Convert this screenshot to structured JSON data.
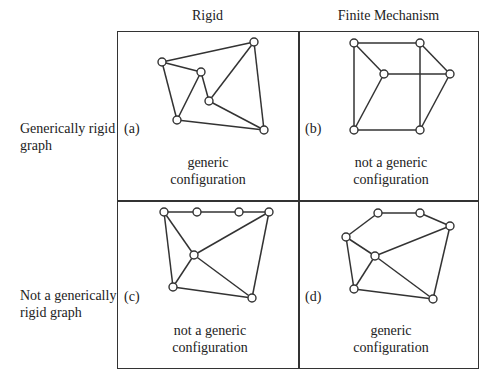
{
  "columns": {
    "rigid": "Rigid",
    "finite_mechanism": "Finite Mechanism"
  },
  "rows": {
    "generically_rigid": [
      "Generically rigid",
      "graph"
    ],
    "not_generically_rigid": [
      "Not a generically",
      "rigid graph"
    ]
  },
  "panels": {
    "a": {
      "tag": "(a)",
      "caption": [
        "generic",
        "configuration"
      ],
      "nodes": [
        [
          162,
          62
        ],
        [
          254,
          42
        ],
        [
          201,
          72
        ],
        [
          209,
          101
        ],
        [
          177,
          120
        ],
        [
          264,
          130
        ]
      ],
      "edges": [
        [
          0,
          1
        ],
        [
          0,
          2
        ],
        [
          0,
          4
        ],
        [
          2,
          4
        ],
        [
          2,
          3
        ],
        [
          1,
          3
        ],
        [
          1,
          5
        ],
        [
          3,
          5
        ],
        [
          4,
          5
        ]
      ]
    },
    "b": {
      "tag": "(b)",
      "caption": [
        "not a generic",
        "configuration"
      ],
      "nodes": [
        [
          354,
          43
        ],
        [
          420,
          43
        ],
        [
          384,
          74
        ],
        [
          450,
          74
        ],
        [
          354,
          130
        ],
        [
          420,
          130
        ]
      ],
      "edges": [
        [
          0,
          1
        ],
        [
          0,
          2
        ],
        [
          0,
          4
        ],
        [
          1,
          3
        ],
        [
          1,
          5
        ],
        [
          2,
          3
        ],
        [
          2,
          4
        ],
        [
          3,
          5
        ],
        [
          4,
          5
        ]
      ]
    },
    "c": {
      "tag": "(c)",
      "caption": [
        "not a generic",
        "configuration"
      ],
      "nodes": [
        [
          164,
          212
        ],
        [
          197,
          212
        ],
        [
          239,
          212
        ],
        [
          269,
          212
        ],
        [
          194,
          255
        ],
        [
          173,
          287
        ],
        [
          252,
          298
        ]
      ],
      "edges": [
        [
          0,
          1
        ],
        [
          1,
          2
        ],
        [
          2,
          3
        ],
        [
          0,
          4
        ],
        [
          0,
          5
        ],
        [
          3,
          4
        ],
        [
          3,
          6
        ],
        [
          4,
          5
        ],
        [
          4,
          6
        ],
        [
          5,
          6
        ]
      ]
    },
    "d": {
      "tag": "(d)",
      "caption": [
        "generic",
        "configuration"
      ],
      "nodes": [
        [
          378,
          213
        ],
        [
          420,
          213
        ],
        [
          450,
          226
        ],
        [
          346,
          237
        ],
        [
          375,
          256
        ],
        [
          354,
          289
        ],
        [
          433,
          299
        ]
      ],
      "edges": [
        [
          0,
          1
        ],
        [
          1,
          2
        ],
        [
          0,
          3
        ],
        [
          3,
          4
        ],
        [
          3,
          5
        ],
        [
          2,
          4
        ],
        [
          2,
          6
        ],
        [
          4,
          5
        ],
        [
          4,
          6
        ],
        [
          5,
          6
        ]
      ]
    }
  }
}
